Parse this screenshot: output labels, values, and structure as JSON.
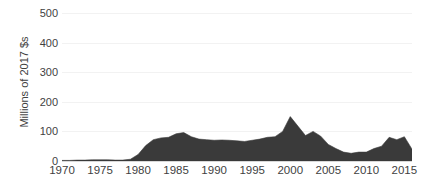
{
  "chart_data": {
    "type": "area",
    "title": "",
    "xlabel": "",
    "ylabel": "Millions of 2017 $s",
    "xlim": [
      1970,
      2016
    ],
    "ylim": [
      0,
      500
    ],
    "grid": true,
    "legend": null,
    "series_color": "#3a3a3a",
    "x_ticks": [
      1970,
      1975,
      1980,
      1985,
      1990,
      1995,
      2000,
      2005,
      2010,
      2015
    ],
    "y_ticks": [
      0,
      100,
      200,
      300,
      400,
      500
    ],
    "x": [
      1970,
      1971,
      1972,
      1973,
      1974,
      1975,
      1976,
      1977,
      1978,
      1979,
      1980,
      1981,
      1982,
      1983,
      1984,
      1985,
      1986,
      1987,
      1988,
      1989,
      1990,
      1991,
      1992,
      1993,
      1994,
      1995,
      1996,
      1997,
      1998,
      1999,
      2000,
      2001,
      2002,
      2003,
      2004,
      2005,
      2006,
      2007,
      2008,
      2009,
      2010,
      2011,
      2012,
      2013,
      2014,
      2015,
      2016
    ],
    "values": [
      2,
      2,
      3,
      3,
      4,
      4,
      4,
      3,
      3,
      6,
      22,
      52,
      72,
      78,
      80,
      92,
      96,
      82,
      74,
      72,
      70,
      71,
      70,
      68,
      66,
      70,
      74,
      80,
      82,
      100,
      150,
      118,
      86,
      100,
      84,
      56,
      42,
      30,
      26,
      30,
      30,
      42,
      50,
      80,
      72,
      82,
      40
    ]
  },
  "axes": {
    "y_title": "Millions of 2017 $s",
    "y_tick_labels": [
      "500",
      "400",
      "300",
      "200",
      "100",
      "0"
    ],
    "x_tick_labels": [
      "1970",
      "1975",
      "1980",
      "1985",
      "1990",
      "1995",
      "2000",
      "2005",
      "2010",
      "2015"
    ]
  }
}
